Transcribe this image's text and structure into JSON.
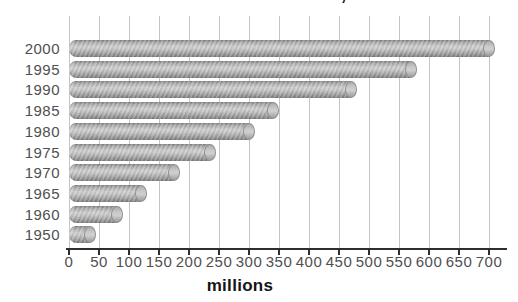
{
  "chart_data": {
    "type": "bar",
    "orientation": "horizontal",
    "bar_style": "3d-cylinder",
    "title": "International tourist arrivals, 1950-2000",
    "categories": [
      "2000",
      "1995",
      "1990",
      "1985",
      "1980",
      "1975",
      "1970",
      "1965",
      "1960",
      "1950"
    ],
    "values": [
      700,
      570,
      470,
      340,
      300,
      235,
      175,
      120,
      80,
      35
    ],
    "xlabel": "millions",
    "xlim": [
      0,
      700
    ],
    "xticks": [
      0,
      50,
      100,
      150,
      200,
      250,
      300,
      350,
      400,
      450,
      500,
      550,
      600,
      650,
      700
    ],
    "grid": true,
    "legend": "none",
    "colors": {
      "background": "#ffffff",
      "bar_light": "#cccccc",
      "bar_dark": "#828282",
      "bar_cap": "#c9c9c9",
      "gridline": "#c4c4c4",
      "axis": "#2e2e2e",
      "tick_label": "#4f4f4f",
      "title_text": "#111111"
    }
  }
}
